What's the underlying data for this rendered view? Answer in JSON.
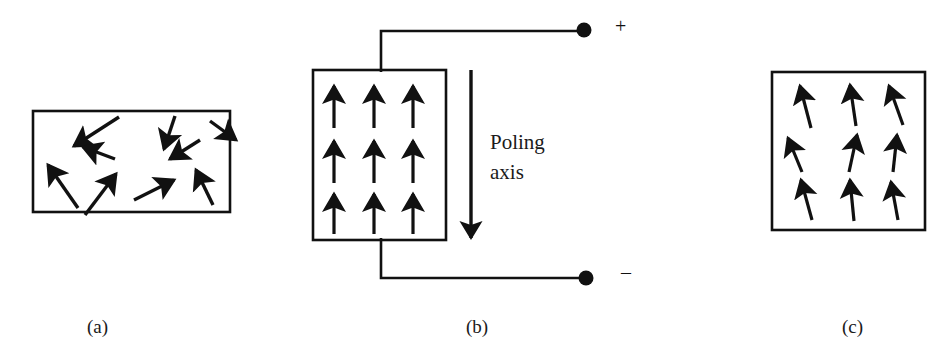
{
  "figure": {
    "width": 952,
    "height": 362,
    "background": "#ffffff",
    "stroke_color": "#111111"
  },
  "captions": {
    "a": "(a)",
    "b": "(b)",
    "c": "(c)"
  },
  "panel_a": {
    "caption": "(a)",
    "box": {
      "x": 33,
      "y": 111,
      "width": 197,
      "height": 101
    },
    "state": "random domain orientation before poling",
    "arrows": [
      {
        "x1": 119,
        "y1": 117,
        "x2": 72,
        "y2": 147,
        "angle_deg": 212
      },
      {
        "x1": 175,
        "y1": 116,
        "x2": 163,
        "y2": 150,
        "angle_deg": 251
      },
      {
        "x1": 210,
        "y1": 121,
        "x2": 237,
        "y2": 140,
        "angle_deg": 325
      },
      {
        "x1": 115,
        "y1": 159,
        "x2": 81,
        "y2": 146,
        "angle_deg": 201
      },
      {
        "x1": 200,
        "y1": 140,
        "x2": 168,
        "y2": 160,
        "angle_deg": 212
      },
      {
        "x1": 78,
        "y1": 208,
        "x2": 46,
        "y2": 163,
        "angle_deg": 125
      },
      {
        "x1": 85,
        "y1": 215,
        "x2": 117,
        "y2": 172,
        "angle_deg": 53
      },
      {
        "x1": 134,
        "y1": 200,
        "x2": 175,
        "y2": 179,
        "angle_deg": 27
      },
      {
        "x1": 213,
        "y1": 205,
        "x2": 195,
        "y2": 168,
        "angle_deg": 64
      }
    ]
  },
  "panel_b": {
    "caption": "(b)",
    "box": {
      "x": 313,
      "y": 70,
      "width": 133,
      "height": 170
    },
    "state": "DC field applied during poling; domains aligned with field",
    "grid": {
      "rows": 3,
      "columns": 3
    },
    "arrow_length": 44,
    "arrow_angle_deg": 90,
    "arrow_origins_x": [
      334,
      374,
      412
    ],
    "arrow_baseline_y": [
      128,
      183,
      234
    ],
    "poling_axis": {
      "label_line_1": "Poling",
      "label_line_2": "axis",
      "label_x": 490,
      "label_y": 128,
      "arrow_x": 471,
      "arrow_y_start": 70,
      "arrow_y_end": 240,
      "direction": "down"
    },
    "circuit": {
      "top_wire": {
        "from_x": 381,
        "from_y": 70,
        "corner_y": 31,
        "to_x": 578
      },
      "bottom_wire": {
        "from_x": 381,
        "from_y": 240,
        "corner_y": 278,
        "to_x": 580
      },
      "positive_terminal": {
        "cx": 584,
        "cy": 30,
        "r": 7,
        "label": "+",
        "label_x": 615,
        "label_y": 17
      },
      "negative_terminal": {
        "cx": 586,
        "cy": 278,
        "r": 7,
        "label": "–",
        "label_x": 621,
        "label_y": 264
      }
    }
  },
  "panel_c": {
    "caption": "(c)",
    "box": {
      "x": 772,
      "y": 72,
      "width": 153,
      "height": 158
    },
    "state": "remanent polarization after field removal; domains nearly aligned",
    "grid": {
      "rows": 3,
      "columns": 3
    },
    "arrow_length": 48,
    "arrows": [
      {
        "x1": 811,
        "y1": 128,
        "x2": 799,
        "y2": 84,
        "tilt_deg": -15
      },
      {
        "x1": 856,
        "y1": 126,
        "x2": 849,
        "y2": 83,
        "tilt_deg": -9
      },
      {
        "x1": 903,
        "y1": 125,
        "x2": 888,
        "y2": 84,
        "tilt_deg": -20
      },
      {
        "x1": 802,
        "y1": 172,
        "x2": 786,
        "y2": 136,
        "tilt_deg": -24
      },
      {
        "x1": 849,
        "y1": 172,
        "x2": 858,
        "y2": 133,
        "tilt_deg": 13
      },
      {
        "x1": 893,
        "y1": 172,
        "x2": 898,
        "y2": 133,
        "tilt_deg": 7
      },
      {
        "x1": 812,
        "y1": 220,
        "x2": 800,
        "y2": 178,
        "tilt_deg": -16
      },
      {
        "x1": 854,
        "y1": 221,
        "x2": 849,
        "y2": 178,
        "tilt_deg": -7
      },
      {
        "x1": 898,
        "y1": 220,
        "x2": 890,
        "y2": 180,
        "tilt_deg": -11
      }
    ]
  }
}
